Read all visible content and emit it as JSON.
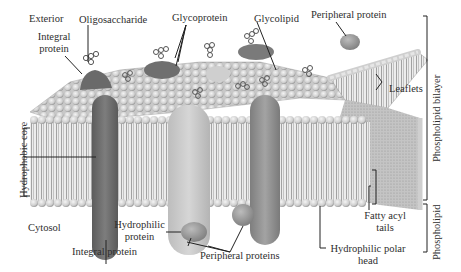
{
  "figure": {
    "regions": {
      "exterior": "Exterior",
      "cytosol": "Cytosol"
    },
    "labels": {
      "oligosaccharide": "Oligosaccharide",
      "glycoprotein": "Glycoprotein",
      "glycolipid": "Glycolipid",
      "peripheral_protein_top": "Peripheral protein",
      "integral_protein_top_line1": "Integral",
      "integral_protein_top_line2": "protein",
      "leaflets": "Leaflets",
      "hydrophobic_core": "Hydrophobic core",
      "integral_protein_bottom": "Integral protein",
      "hydrophilic_protein_line1": "Hydrophilic",
      "hydrophilic_protein_line2": "protein",
      "peripheral_proteins": "Peripheral proteins",
      "hydrophilic_polar_head_line1": "Hydrophilic polar",
      "hydrophilic_polar_head_line2": "head",
      "fatty_acyl_tails_line1": "Fatty acyl",
      "fatty_acyl_tails_line2": "tails",
      "phospholipid_bilayer": "Phospholipid bilayer",
      "phospholipid": "Phospholipid"
    },
    "colors": {
      "background": "#ffffff",
      "head_group": "#d9d9d9",
      "head_shadow": "#9a9a9a",
      "tail": "#8a8a8a",
      "protein_dark": "#6e6e6e",
      "protein_light": "#c4c4c4",
      "protein_mid": "#8c8c8c",
      "leader_line": "#222222"
    }
  }
}
